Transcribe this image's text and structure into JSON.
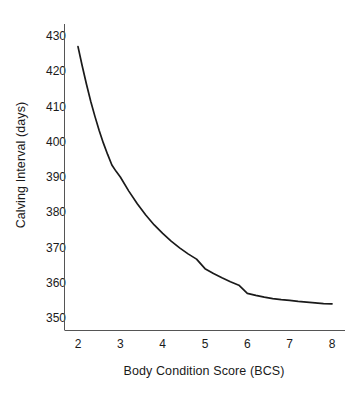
{
  "chart_data": {
    "type": "line",
    "title": "",
    "subtitle": "",
    "xlabel": "Body Condition Score (BCS)",
    "ylabel": "Calving Interval (days)",
    "xlim": [
      1.72,
      8.2
    ],
    "ylim": [
      346.5,
      432.5
    ],
    "xticks": [
      "2",
      "3",
      "4",
      "5",
      "6",
      "7",
      "8"
    ],
    "yticks": [
      "350",
      "360",
      "370",
      "380",
      "390",
      "400",
      "410",
      "420",
      "430"
    ],
    "grid": false,
    "legend": null,
    "legend_position": "none",
    "annotations": [],
    "line_color": "#1a1a1a",
    "background_color": "#ffffff",
    "x": [
      2.0,
      2.1,
      2.2,
      2.3,
      2.4,
      2.5,
      2.6,
      2.7,
      2.8,
      2.9,
      3.0,
      3.2,
      3.4,
      3.6,
      3.8,
      4.0,
      4.2,
      4.4,
      4.6,
      4.8,
      5.0,
      5.2,
      5.4,
      5.6,
      5.8,
      6.0,
      6.2,
      6.4,
      6.6,
      6.8,
      7.0,
      7.2,
      7.4,
      7.6,
      7.8,
      8.0
    ],
    "values": [
      427.0,
      421.5,
      416.3,
      411.5,
      407.2,
      403.2,
      399.6,
      396.4,
      393.4,
      391.6,
      390.0,
      386.0,
      382.4,
      379.2,
      376.4,
      374.0,
      371.8,
      369.9,
      368.2,
      366.7,
      364.0,
      362.6,
      361.4,
      360.3,
      359.3,
      357.0,
      356.4,
      355.9,
      355.5,
      355.2,
      355.0,
      354.7,
      354.5,
      354.3,
      354.1,
      354.0
    ],
    "series": [
      {
        "name": "Calving interval vs BCS",
        "values": [
          427.0,
          421.5,
          416.3,
          411.5,
          407.2,
          403.2,
          399.6,
          396.4,
          393.4,
          391.6,
          390.0,
          386.0,
          382.4,
          379.2,
          376.4,
          374.0,
          371.8,
          369.9,
          368.2,
          366.7,
          364.0,
          362.6,
          361.4,
          360.3,
          359.3,
          357.0,
          356.4,
          355.9,
          355.5,
          355.2,
          355.0,
          354.7,
          354.5,
          354.3,
          354.1,
          354.0
        ]
      }
    ],
    "key_points": {
      "bcs_2": 427,
      "bcs_3": 390,
      "bcs_4": 374,
      "bcs_5": 364,
      "bcs_6": 357,
      "bcs_7": 355,
      "bcs_8": 354,
      "asymptote": 354
    }
  }
}
